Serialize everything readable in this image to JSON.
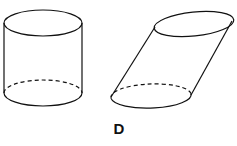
{
  "figure": {
    "label": "D",
    "shapes": [
      {
        "name": "right-cylinder",
        "description": "upright circular cylinder with dashed hidden bottom edge"
      },
      {
        "name": "oblique-cylinder",
        "description": "slanted circular cylinder with dashed hidden bottom edge"
      }
    ],
    "stroke_color": "#111111",
    "background": "#ffffff"
  }
}
